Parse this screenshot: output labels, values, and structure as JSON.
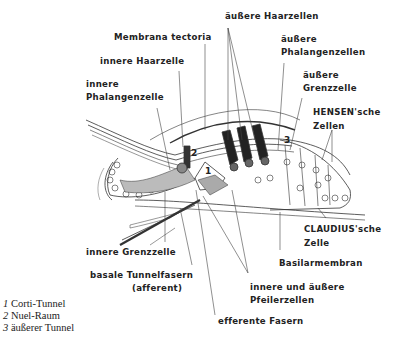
{
  "diagram": {
    "labels": {
      "membrana_tectoria": "Membrana tectoria",
      "innere_haarzelle": "innere Haarzelle",
      "innere_phalangenzelle_1": "innere",
      "innere_phalangenzelle_2": "Phalangenzelle",
      "aeussere_haarzellen": "äußere Haarzellen",
      "aeussere_phalangenzellen_1": "äußere",
      "aeussere_phalangenzellen_2": "Phalangenzellen",
      "aeussere_grenzzelle_1": "äußere",
      "aeussere_grenzzelle_2": "Grenzzelle",
      "hensen_1": "HENSEN'sche",
      "hensen_2": "Zellen",
      "claudius_1": "CLAUDIUS'sche",
      "claudius_2": "Zelle",
      "basilarmembran": "Basilarmembran",
      "pfeilerzellen_1": "innere und äußere",
      "pfeilerzellen_2": "Pfeilerzellen",
      "efferente_fasern": "efferente Fasern",
      "innere_grenzzelle": "innere Grenzzelle",
      "basale_tunnelfasern_1": "basale Tunnelfasern",
      "basale_tunnelfasern_2": "(afferent)"
    },
    "region_numbers": [
      "1",
      "2",
      "3"
    ],
    "legend": [
      {
        "num": "1",
        "text": "Corti-Tunnel"
      },
      {
        "num": "2",
        "text": "Nuel-Raum"
      },
      {
        "num": "3",
        "text": "äußerer Tunnel"
      }
    ]
  }
}
